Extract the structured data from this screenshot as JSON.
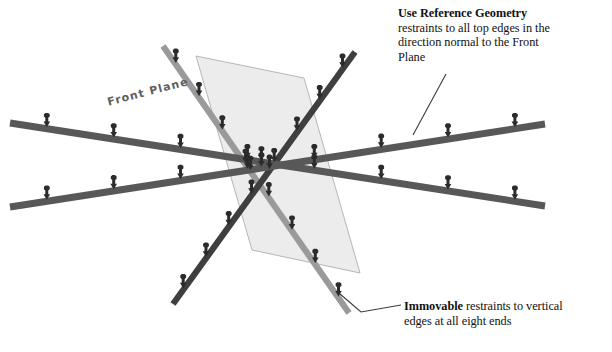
{
  "figure": {
    "kind": "isometric-restraint-diagram",
    "background": "#ffffff"
  },
  "plane": {
    "label": "Front Plane",
    "fill": "#ececec",
    "stroke": "#b8b8b8"
  },
  "colors": {
    "beam_dark": "#585858",
    "beam_light": "#9a9a9a",
    "arrow": "#2b2b2b",
    "leader": "#3a3a3a",
    "text": "#111111"
  },
  "annotations": {
    "top": {
      "bold": "Use Reference Geometry",
      "line2": "restraints to all top edges in the",
      "line3": "direction normal to the Front",
      "line4": "Plane"
    },
    "bottom": {
      "bold": "Immovable",
      "rest1": " restraints to vertical",
      "line2": "edges at all eight ends"
    }
  },
  "beams": [
    {
      "name": "beam-front-horizontal",
      "x1": 10,
      "y1": 123,
      "x2": 545,
      "y2": 206,
      "width": 7.0,
      "shade": "#585858",
      "arrows": 8
    },
    {
      "name": "beam-back-horizontal",
      "x1": 10,
      "y1": 207,
      "x2": 545,
      "y2": 124,
      "width": 7.0,
      "shade": "#585858",
      "arrows": 8
    },
    {
      "name": "beam-diagonal-left",
      "x1": 163,
      "y1": 46,
      "x2": 349,
      "y2": 313,
      "width": 6.2,
      "shade": "#9a9a9a",
      "arrows": 8
    },
    {
      "name": "beam-diagonal-right",
      "x1": 355,
      "y1": 52,
      "x2": 173,
      "y2": 304,
      "width": 6.2,
      "shade": "#3f3f3f",
      "arrows": 8
    }
  ],
  "leaders": [
    {
      "name": "leader-top",
      "points": "446,74 413,135"
    },
    {
      "name": "leader-bottom",
      "points": "340,294 360,312 400,305"
    }
  ]
}
